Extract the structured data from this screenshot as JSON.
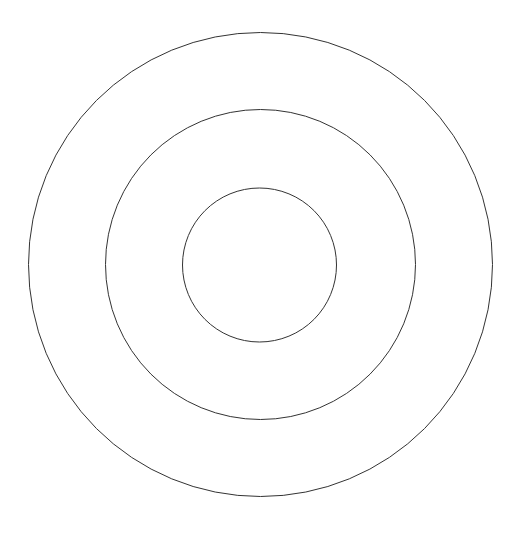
{
  "canvas": {
    "width": 517,
    "height": 535,
    "background": "#ffffff"
  },
  "stroke": {
    "color": "#333333",
    "width": 1
  },
  "circles": [
    {
      "name": "outer-ring",
      "cx": 260.5,
      "cy": 264.5,
      "r": 232
    },
    {
      "name": "middle-ring",
      "cx": 260.5,
      "cy": 264.5,
      "r": 155
    },
    {
      "name": "inner-ring",
      "cx": 259.5,
      "cy": 265,
      "r": 77
    }
  ]
}
